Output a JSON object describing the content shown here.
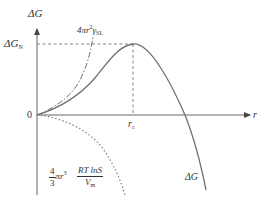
{
  "diagram": {
    "colors": {
      "axis": "#555555",
      "total_curve": "#707070",
      "surface_curve": "#707070",
      "volume_curve": "#808080",
      "guide_lines": "#777777",
      "text": "#333333"
    },
    "axes": {
      "y_label": "ΔG",
      "x_label": "r",
      "origin_label": "0"
    },
    "markers": {
      "critical_energy_label_main": "ΔG",
      "critical_energy_label_sub": "N",
      "critical_radius_label_main": "r",
      "critical_radius_label_sub": "c"
    },
    "curves": {
      "surface_term": {
        "style": "dash-dot",
        "label_prefix": "4πr",
        "label_exp": "2",
        "label_gamma": "γ",
        "label_sub": "SL"
      },
      "volume_term": {
        "style": "dotted",
        "label_coef_num": "4",
        "label_coef_den": "3",
        "label_pi_r": "πr",
        "label_exp": "3",
        "label_num": "RT lnS",
        "label_den_main": "V",
        "label_den_sub": "m"
      },
      "total": {
        "style": "solid",
        "label": "ΔG"
      }
    }
  }
}
